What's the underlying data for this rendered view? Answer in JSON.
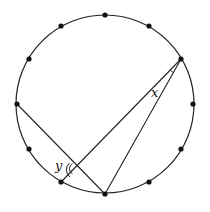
{
  "diagram": {
    "circle": {
      "cx": 105,
      "cy": 104,
      "r": 89,
      "stroke": "#222222"
    },
    "points": [
      {
        "x": 105,
        "y": 15
      },
      {
        "x": 149,
        "y": 26
      },
      {
        "x": 181,
        "y": 59
      },
      {
        "x": 193,
        "y": 104
      },
      {
        "x": 181,
        "y": 149
      },
      {
        "x": 149,
        "y": 182
      },
      {
        "x": 105,
        "y": 194
      },
      {
        "x": 61,
        "y": 182
      },
      {
        "x": 29,
        "y": 149
      },
      {
        "x": 17,
        "y": 104
      },
      {
        "x": 29,
        "y": 59
      },
      {
        "x": 61,
        "y": 26
      }
    ],
    "segments": [
      {
        "x1": 17,
        "y1": 104,
        "x2": 105,
        "y2": 194
      },
      {
        "x1": 61,
        "y1": 182,
        "x2": 181,
        "y2": 59
      },
      {
        "x1": 105,
        "y1": 194,
        "x2": 181,
        "y2": 59
      }
    ],
    "labels": {
      "x": "x",
      "y": "y"
    }
  }
}
